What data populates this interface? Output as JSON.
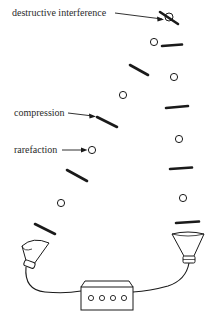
{
  "labels": {
    "destructive_interference": "destructive interference",
    "compression": "compression",
    "rarefaction": "rarefaction"
  },
  "colors": {
    "ink": "#1a1a1a",
    "background": "#ffffff"
  },
  "legend": {
    "compression_symbol": "thick-bar",
    "rarefaction_symbol": "open-circle"
  },
  "wavefronts": {
    "left_source": {
      "compressions": [
        [
          130,
          65,
          148,
          75
        ],
        [
          97,
          117,
          117,
          127
        ],
        [
          67,
          170,
          87,
          180
        ],
        [
          35,
          224,
          55,
          234
        ]
      ],
      "rarefactions": [
        [
          123,
          95
        ],
        [
          92,
          150
        ],
        [
          61,
          203
        ]
      ]
    },
    "right_source": {
      "compressions": [
        [
          162,
          46,
          182,
          44
        ],
        [
          165,
          108,
          188,
          106
        ],
        [
          168,
          169,
          188,
          167
        ],
        [
          175,
          223,
          200,
          221
        ]
      ],
      "rarefactions": [
        [
          154,
          42
        ],
        [
          174,
          77
        ],
        [
          179,
          140
        ],
        [
          182,
          198
        ]
      ]
    },
    "interference_point": [
      170,
      17
    ]
  },
  "equipment": {
    "speakers": [
      "left-speaker",
      "right-speaker"
    ],
    "amplifier_knobs": 4
  }
}
